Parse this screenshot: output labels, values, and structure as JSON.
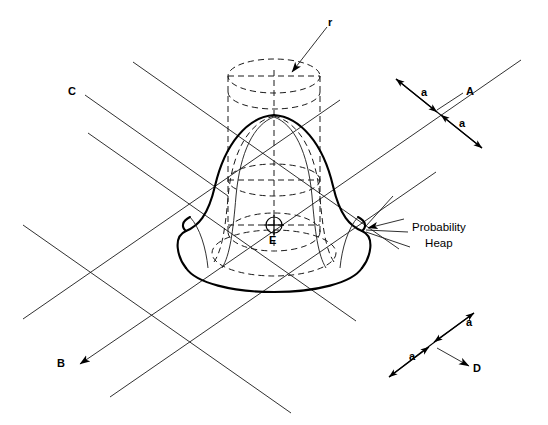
{
  "figure": {
    "type": "technical-diagram",
    "background_color": "#ffffff",
    "line_color": "#000000",
    "stroke_thin": 0.9,
    "stroke_bold": 2.0
  },
  "labels": {
    "radius": "r",
    "axis_a": "A",
    "axis_b": "B",
    "axis_c": "C",
    "axis_d": "D",
    "center_point": "E",
    "heap_line1": "Probability",
    "heap_line2": "Heap",
    "dim_a_top_upper": "a",
    "dim_a_top_lower": "a",
    "dim_a_bottom_upper": "a",
    "dim_a_bottom_lower": "a"
  },
  "label_positions": {
    "radius": {
      "x": 328,
      "y": 16
    },
    "axis_a": {
      "x": 466,
      "y": 88
    },
    "axis_b": {
      "x": 57,
      "y": 359
    },
    "axis_c": {
      "x": 68,
      "y": 87
    },
    "axis_d": {
      "x": 473,
      "y": 366
    },
    "center_point": {
      "x": 268,
      "y": 236
    },
    "heap_text": {
      "x": 412,
      "y": 222
    },
    "dim_a_top_upper": {
      "x": 421,
      "y": 88
    },
    "dim_a_top_lower": {
      "x": 459,
      "y": 118
    },
    "dim_a_bottom_upper": {
      "x": 466,
      "y": 318
    },
    "dim_a_bottom_lower": {
      "x": 409,
      "y": 352
    }
  },
  "geometry": {
    "cylinder": {
      "center_x": 274,
      "top_ellipse_y": 76,
      "bottom_ellipse_y": 118,
      "rx": 46,
      "ry": 17,
      "wall_left_x": 228,
      "wall_right_x": 320,
      "wall_bottom_y": 232
    },
    "base_ellipse": {
      "cx": 274,
      "cy": 232,
      "rx": 46,
      "ry": 19
    },
    "mid_ellipse": {
      "cx": 274,
      "cy": 180,
      "rx": 46,
      "ry": 16
    },
    "lower_ellipse": {
      "cx": 274,
      "cy": 255,
      "rx": 62,
      "ry": 22
    },
    "center_marker": {
      "cx": 274,
      "cy": 225,
      "r": 8
    },
    "heap_apex": {
      "x": 274,
      "y": 115
    },
    "heap_base_y": 282,
    "heap_half_width": 96
  },
  "grid_lines": {
    "description": "Two families of parallel oblique lines forming the ground plane",
    "family_ac": {
      "direction": "upper-left to lower-right",
      "count": 3
    },
    "family_bd": {
      "direction": "lower-left to upper-right",
      "count": 3
    }
  }
}
